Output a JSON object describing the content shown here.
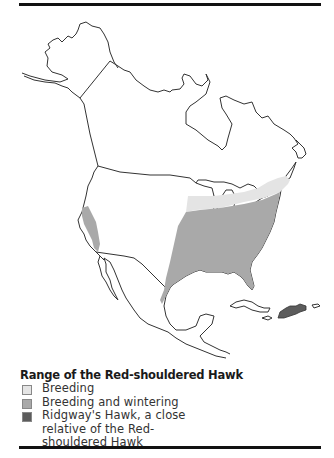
{
  "figure": {
    "title": "Range of the Red-shouldered Hawk",
    "legend": [
      {
        "key": "breeding",
        "label": "Breeding",
        "color": "#e4e4e4"
      },
      {
        "key": "breeding_wintering",
        "label": "Breeding and wintering",
        "color": "#a9a9a9"
      },
      {
        "key": "ridgways",
        "label": "Ridgway's Hawk, a close relative of the Red-shouldered Hawk",
        "color": "#5c5c5c"
      }
    ],
    "map": {
      "region": "North America",
      "outline_color": "#333333",
      "fills": {
        "breeding": "#e4e4e4",
        "breeding_wintering": "#a9a9a9",
        "ridgways": "#5c5c5c"
      }
    }
  }
}
